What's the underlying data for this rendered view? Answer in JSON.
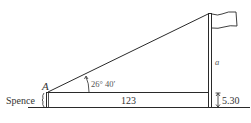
{
  "diagram": {
    "labels": {
      "point_a": "A",
      "building": "Spence",
      "angle": "26° 40′",
      "height_var": "a",
      "distance": "123",
      "building_height": "5.30"
    },
    "colors": {
      "line": "#2a2a2a",
      "text": "#333333",
      "angle_text": "#555555",
      "background": "#ffffff"
    }
  }
}
